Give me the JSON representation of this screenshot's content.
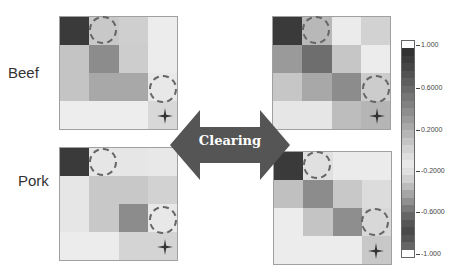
{
  "labels": {
    "beef": "Beef",
    "pork": "Pork",
    "arrow": "Clearing"
  },
  "colorbar": {
    "ticks": [
      "1.000",
      "0.6000",
      "0.2000",
      "-0.2000",
      "-0.6000",
      "-1.000"
    ],
    "range": [
      -1.0,
      1.0
    ]
  },
  "matrices": {
    "beef_before": [
      [
        "#3a3a3a",
        "#c8c8c8",
        "#cfcfcf",
        "#ececec"
      ],
      [
        "#c4c4c4",
        "#8c8c8c",
        "#cdcdcd",
        "#ececec"
      ],
      [
        "#c4c4c4",
        "#a8a8a8",
        "#a8a8a8",
        "#e8e8e8"
      ],
      [
        "#ededed",
        "#ededed",
        "#ededed",
        "#d8d8d8"
      ]
    ],
    "beef_after": [
      [
        "#3a3a3a",
        "#b8b8b8",
        "#ebebeb",
        "#d2d2d2"
      ],
      [
        "#9a9a9a",
        "#6e6e6e",
        "#c6c6c6",
        "#ececec"
      ],
      [
        "#c6c6c6",
        "#a8a8a8",
        "#8c8c8c",
        "#cccccc"
      ],
      [
        "#e6e6e6",
        "#e6e6e6",
        "#bdbdbd",
        "#b5b5b5"
      ]
    ],
    "pork_before": [
      [
        "#3a3a3a",
        "#e6e6e6",
        "#e6e6e6",
        "#e8e8e8"
      ],
      [
        "#e6e6e6",
        "#c8c8c8",
        "#c8c8c8",
        "#d2d2d2"
      ],
      [
        "#e6e6e6",
        "#c8c8c8",
        "#8c8c8c",
        "#e8e8e8"
      ],
      [
        "#ececec",
        "#ececec",
        "#d4d4d4",
        "#d4d4d4"
      ]
    ],
    "pork_after": [
      [
        "#3a3a3a",
        "#e0e0e0",
        "#ebebeb",
        "#ebebeb"
      ],
      [
        "#c0c0c0",
        "#8c8c8c",
        "#c8c8c8",
        "#dcdcdc"
      ],
      [
        "#ececec",
        "#c4c4c4",
        "#8e8e8e",
        "#d8d8d8"
      ],
      [
        "#ececec",
        "#ececec",
        "#ececec",
        "#c8c8c8"
      ]
    ]
  }
}
